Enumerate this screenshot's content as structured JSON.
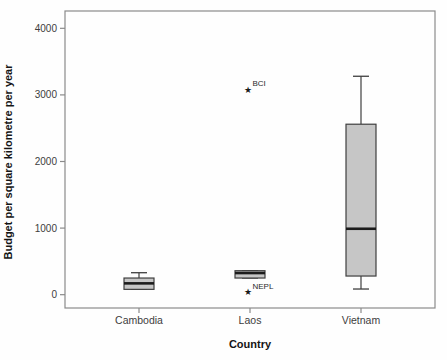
{
  "figure": {
    "width_px": 447,
    "height_px": 360,
    "background": "#fefefe"
  },
  "chart_data": {
    "type": "boxplot",
    "title": "",
    "xlabel": "Country",
    "ylabel": "Budget per square kilometre per year",
    "categories": [
      "Cambodia",
      "Laos",
      "Vietnam"
    ],
    "yticks": [
      0,
      1000,
      2000,
      3000,
      4000
    ],
    "ylim": [
      -200,
      4260
    ],
    "grid": false,
    "legend": "none",
    "series": [
      {
        "category": "Cambodia",
        "min": 80,
        "q1": 80,
        "median": 170,
        "q3": 250,
        "max": 330,
        "outliers": []
      },
      {
        "category": "Laos",
        "min": 250,
        "q1": 250,
        "median": 325,
        "q3": 360,
        "max": 360,
        "outliers": [
          {
            "label": "BCI",
            "value": 3075
          },
          {
            "label": "NEPL",
            "value": 40
          }
        ]
      },
      {
        "category": "Vietnam",
        "min": 85,
        "q1": 280,
        "median": 990,
        "q3": 2560,
        "max": 3280,
        "outliers": []
      }
    ],
    "colors": {
      "box_fill": "#c6c6c6",
      "box_border": "#3f3f3f",
      "median": "#1c1c1c",
      "frame": "#8a8a8a",
      "tick": "#8a8a8a",
      "tick_label": "#3d3d3d",
      "axis_title": "#151515",
      "outlier": "#1a1a1a",
      "outlier_label": "#2a2a2a"
    },
    "style": {
      "outlier_symbol": "star",
      "box_width_px": 30,
      "cap_width_px": 16
    }
  }
}
